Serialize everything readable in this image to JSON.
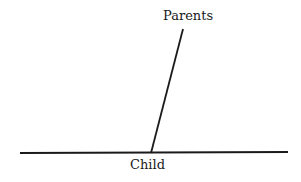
{
  "diagram": {
    "type": "pedigree-link",
    "nodes": [
      {
        "id": "parents",
        "label": "Parents"
      },
      {
        "id": "child",
        "label": "Child"
      }
    ],
    "edges": [
      {
        "from": "parents",
        "to": "child"
      }
    ],
    "baseline_label": "Child",
    "line_color": "#1a1a1a"
  }
}
